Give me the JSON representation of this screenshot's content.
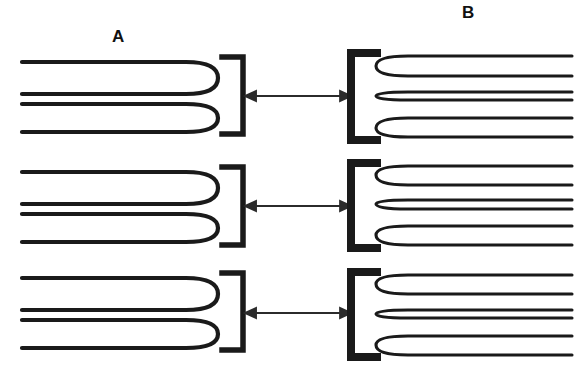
{
  "figure": {
    "type": "diagram",
    "title": "",
    "background_color": "#ffffff",
    "ink_color": "#1a1a1a",
    "width": 575,
    "height": 383
  },
  "labels": {
    "panel_a": "A",
    "panel_b": "B"
  },
  "panels": [
    {
      "id": "A",
      "name": "extended-loop-panel",
      "label": "A",
      "label_x": 112,
      "label_y": 28,
      "side": "left",
      "loops_per_unit": 2,
      "stroke_width": 4,
      "fiber_extends_to_edge": "left",
      "bracket": {
        "orientation": "right",
        "name": "closing-bracket",
        "stroke_width": 5,
        "x": 240,
        "arm_length": 20
      },
      "units": [
        {
          "index": 1,
          "top": 57,
          "bottom": 134,
          "loop_tip_x": 216,
          "strand_ys": [
            62,
            94,
            104,
            131
          ]
        },
        {
          "index": 2,
          "top": 167,
          "bottom": 245,
          "loop_tip_x": 216,
          "strand_ys": [
            172,
            204,
            214,
            241
          ]
        },
        {
          "index": 3,
          "top": 273,
          "bottom": 350,
          "loop_tip_x": 216,
          "strand_ys": [
            278,
            310,
            320,
            346
          ]
        }
      ]
    },
    {
      "id": "B",
      "name": "condensed-loop-panel",
      "label": "B",
      "label_x": 462,
      "label_y": 4,
      "side": "right",
      "loops_per_unit": 3,
      "stroke_width": 3,
      "fiber_extends_to_edge": "right",
      "bracket": {
        "orientation": "left",
        "name": "opening-bracket",
        "stroke_width": 8,
        "x": 350,
        "arm_length": 27
      },
      "units": [
        {
          "index": 1,
          "top": 50,
          "bottom": 143,
          "loop_tip_x": 380,
          "strand_ys": [
            56,
            76,
            92,
            100,
            118,
            137
          ]
        },
        {
          "index": 2,
          "top": 161,
          "bottom": 250,
          "loop_tip_x": 380,
          "strand_ys": [
            166,
            185,
            200,
            209,
            226,
            245
          ]
        },
        {
          "index": 3,
          "top": 270,
          "bottom": 360,
          "loop_tip_x": 380,
          "strand_ys": [
            275,
            294,
            310,
            318,
            336,
            355
          ]
        }
      ]
    }
  ],
  "arrows": [
    {
      "name": "transition-arrow-1",
      "direction": "bidirectional",
      "x1": 252,
      "x2": 344,
      "y": 96
    },
    {
      "name": "transition-arrow-2",
      "direction": "bidirectional",
      "x1": 252,
      "x2": 344,
      "y": 206
    },
    {
      "name": "transition-arrow-3",
      "direction": "bidirectional",
      "x1": 252,
      "x2": 344,
      "y": 313
    }
  ]
}
